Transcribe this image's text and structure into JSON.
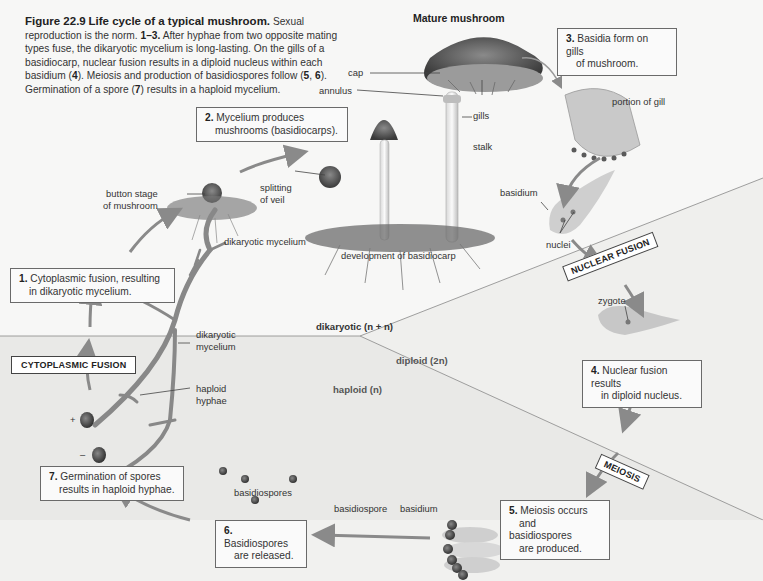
{
  "caption": {
    "figure_label": "Figure 22.9",
    "figure_title": "Life cycle of a typical mushroom.",
    "text_1": "Sexual reproduction is the norm.",
    "bold_range": "1–3.",
    "text_2": "After hyphae from two opposite mating types fuse, the dikaryotic mycelium is long-lasting. On the gills of a basidiocarp, nuclear fusion results in a diploid nucleus within each basidium (",
    "bold_4": "4",
    "text_3": "). Meiosis and production of basidiospores follow (",
    "bold_5": "5",
    "sep": ", ",
    "bold_6": "6",
    "text_4": "). Germination of a spore (",
    "bold_7": "7",
    "text_5": ") results in a haploid mycelium."
  },
  "headings": {
    "mature_mushroom": "Mature mushroom"
  },
  "steps": [
    {
      "num": "1.",
      "text_line1": "Cytoplasmic fusion, resulting",
      "text_line2": "in dikaryotic mycelium."
    },
    {
      "num": "2.",
      "text_line1": "Mycelium produces",
      "text_line2": "mushrooms (basidiocarps)."
    },
    {
      "num": "3.",
      "text_line1": "Basidia form on gills",
      "text_line2": "of mushroom."
    },
    {
      "num": "4.",
      "text_line1": "Nuclear fusion results",
      "text_line2": "in diploid nucleus."
    },
    {
      "num": "5.",
      "text_line1": "Meiosis occurs",
      "text_line2": "and basidiospores",
      "text_line3": "are produced."
    },
    {
      "num": "6.",
      "text_line1": "Basidiospores",
      "text_line2": "are released."
    },
    {
      "num": "7.",
      "text_line1": "Germination of spores",
      "text_line2": "results in haploid hyphae."
    }
  ],
  "process_tags": {
    "cytoplasmic_fusion": "CYTOPLASMIC FUSION",
    "nuclear_fusion": "NUCLEAR FUSION",
    "meiosis": "MEIOSIS"
  },
  "regions": {
    "dikaryotic": "dikaryotic (n + n)",
    "diploid": "diploid (2n)",
    "haploid": "haploid (n)"
  },
  "labels": {
    "cap": "cap",
    "annulus": "annulus",
    "gills": "gills",
    "stalk": "stalk",
    "portion_of_gill": "portion of gill",
    "basidium_top": "basidium",
    "nuclei": "nuclei",
    "zygote": "zygote",
    "button_stage_1": "button stage",
    "button_stage_2": "of mushroom",
    "splitting_1": "splitting",
    "splitting_2": "of veil",
    "dikaryotic_mycelium_top": "dikaryotic mycelium",
    "development": "development of basidiocarp",
    "dikaryotic_mycelium_1": "dikaryotic",
    "dikaryotic_mycelium_2": "mycelium",
    "haploid_hyphae_1": "haploid",
    "haploid_hyphae_2": "hyphae",
    "plus": "+",
    "minus": "–",
    "basidiospores": "basidiospores",
    "basidiospore": "basidiospore",
    "basidium_bottom": "basidium"
  },
  "colors": {
    "background": "#f7f7f6",
    "haploid_region": "#e6e6e4",
    "diploid_region": "#eeeeec",
    "arrow": "#8a8a8a",
    "box_border": "#6a6a6a"
  }
}
